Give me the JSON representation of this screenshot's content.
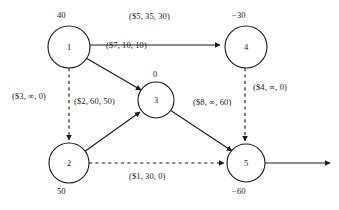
{
  "diagram": {
    "stroke_color": "#1a1a1a",
    "text_color": "#1a1a1a",
    "background": "#ffffff",
    "edge_label_format": "(cost, capacity, flow)"
  },
  "nodes": [
    {
      "id": "1",
      "label": "1",
      "supply": "40",
      "cx": 69,
      "cy": 47,
      "r": 21
    },
    {
      "id": "2",
      "label": "2",
      "supply": "50",
      "cx": 69,
      "cy": 163,
      "r": 20
    },
    {
      "id": "3",
      "label": "3",
      "supply": "0",
      "cx": 156,
      "cy": 100,
      "r": 18
    },
    {
      "id": "4",
      "label": "4",
      "supply": "−30",
      "cx": 246,
      "cy": 47,
      "r": 21
    },
    {
      "id": "5",
      "label": "5",
      "supply": "−60",
      "cx": 246,
      "cy": 163,
      "r": 19
    }
  ],
  "edges": [
    {
      "id": "e1-4",
      "from": "1",
      "to": "4",
      "label": "($5, 35, 30)",
      "style": "solid"
    },
    {
      "id": "e1-3",
      "from": "1",
      "to": "3",
      "label": "($7, 10, 10)",
      "style": "solid"
    },
    {
      "id": "e1-2",
      "from": "1",
      "to": "2",
      "label": "($3, ∞, 0)",
      "style": "dashed"
    },
    {
      "id": "e2-3",
      "from": "2",
      "to": "3",
      "label": "($2, 60, 50)",
      "style": "solid"
    },
    {
      "id": "e3-5",
      "from": "3",
      "to": "5",
      "label": "($8, ∞, 60)",
      "style": "solid"
    },
    {
      "id": "e4-5",
      "from": "4",
      "to": "5",
      "label": "($4, ∞, 0)",
      "style": "dashed"
    },
    {
      "id": "e2-5",
      "from": "2",
      "to": "5",
      "label": "($1, 30, 0)",
      "style": "dashed"
    },
    {
      "id": "e5-out",
      "from": "5",
      "to": "sink",
      "label": "",
      "style": "solid"
    }
  ]
}
